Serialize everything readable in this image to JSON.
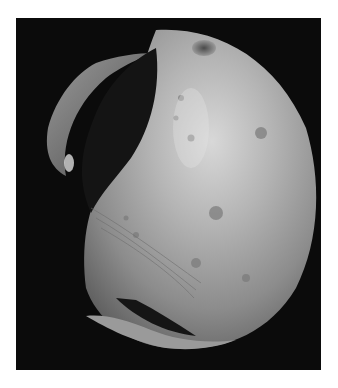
{
  "image": {
    "subject": "grayscale photograph of an irregular moon with large crater and shadowed limb",
    "background_color": "#0b0b0b",
    "border_color": "#ffffff",
    "frame": {
      "x": 16,
      "y": 18,
      "width": 305,
      "height": 352
    }
  }
}
